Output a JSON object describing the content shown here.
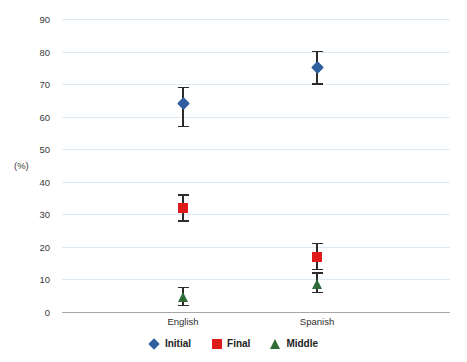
{
  "chart_data": {
    "type": "scatter",
    "title": "",
    "subtitle": "",
    "xlabel": "",
    "ylabel": "(%)",
    "categories": [
      "English",
      "Spanish"
    ],
    "ylim": [
      0,
      90
    ],
    "ytick_step": 10,
    "yticks": [
      0,
      10,
      20,
      30,
      40,
      50,
      60,
      70,
      80,
      90
    ],
    "ytick_labels": [
      "0",
      "10",
      "20",
      "30",
      "40",
      "50",
      "60",
      "70",
      "80",
      "90"
    ],
    "grid": true,
    "legend_position": "bottom",
    "series": [
      {
        "name": "Initial",
        "marker": "diamond",
        "color": "#2e5f9e",
        "values": [
          64,
          75
        ],
        "err_low": [
          7,
          5
        ],
        "err_high": [
          5,
          5
        ]
      },
      {
        "name": "Final",
        "marker": "square",
        "color": "#e01b1b",
        "values": [
          32,
          17
        ],
        "err_low": [
          4,
          4
        ],
        "err_high": [
          4,
          4
        ]
      },
      {
        "name": "Middle",
        "marker": "triangle",
        "color": "#2f6b36",
        "values": [
          4.5,
          8.5
        ],
        "err_low": [
          2.5,
          2.5
        ],
        "err_high": [
          3,
          3.5
        ]
      }
    ]
  },
  "legend": {
    "items": [
      {
        "label": "Initial",
        "marker": "diamond",
        "color": "#2e5f9e"
      },
      {
        "label": "Final",
        "marker": "square",
        "color": "#e01b1b"
      },
      {
        "label": "Middle",
        "marker": "triangle",
        "color": "#2f6b36"
      }
    ]
  },
  "colors": {
    "gridline": "#dce9f2",
    "axis": "#a6a6a6",
    "errorbar": "#2b2b2b",
    "text": "#333333",
    "background": "#ffffff"
  }
}
